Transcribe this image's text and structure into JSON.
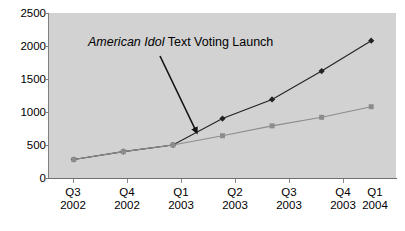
{
  "chart_data": {
    "type": "line",
    "title": "",
    "subtitle": "",
    "xlabel": "",
    "ylabel": "",
    "ylim": [
      0,
      2500
    ],
    "yticks": [
      0,
      500,
      1000,
      1500,
      2000,
      2500
    ],
    "ytick_labels": [
      "0",
      "500",
      "1000",
      "1500",
      "2000",
      "2500"
    ],
    "grid": false,
    "legend": "none",
    "categories": [
      {
        "quarter": "Q3",
        "year": "2002"
      },
      {
        "quarter": "Q4",
        "year": "2002"
      },
      {
        "quarter": "Q1",
        "year": "2003"
      },
      {
        "quarter": "Q2",
        "year": "2003"
      },
      {
        "quarter": "Q3",
        "year": "2003"
      },
      {
        "quarter": "Q4",
        "year": "2003"
      },
      {
        "quarter": "Q1",
        "year": "2004"
      }
    ],
    "categories_flat": [
      "Q3 2002",
      "Q4 2002",
      "Q1 2003",
      "Q2 2003",
      "Q3 2003",
      "Q4 2003",
      "Q1 2004"
    ],
    "series": [
      {
        "name": "upper-series",
        "marker": "diamond",
        "color": "#222222",
        "values": [
          280,
          400,
          500,
          900,
          1190,
          1620,
          2080
        ]
      },
      {
        "name": "lower-series",
        "marker": "square",
        "color": "#8c8c8c",
        "values": [
          280,
          400,
          500,
          640,
          790,
          920,
          1080
        ]
      }
    ],
    "annotations": [
      {
        "name": "text-voting-launch",
        "italic_text": "American Idol",
        "plain_text": " Text Voting Launch",
        "arrow": {
          "from_x": 160,
          "from_y": 56,
          "to_x": 196,
          "to_y": 131
        }
      }
    ],
    "colors": {
      "plot_background": "#d2d2d2",
      "page_background": "#ffffff",
      "axis": "#808080",
      "text": "#000000",
      "series_dark": "#222222",
      "series_gray": "#8c8c8c"
    }
  }
}
